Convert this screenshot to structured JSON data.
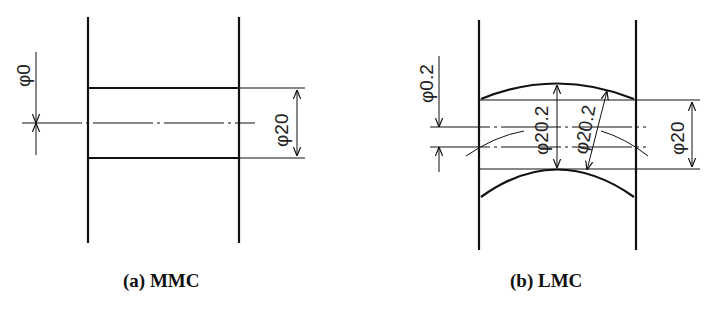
{
  "figure": {
    "panels": [
      {
        "id": "a",
        "caption": "(a) MMC",
        "caption_prefix": "(a)",
        "caption_label": "MMC",
        "dimensions": {
          "position_tolerance": "φ0",
          "hole_diameter": "φ20"
        }
      },
      {
        "id": "b",
        "caption": "(b) LMC",
        "caption_prefix": "(b)",
        "caption_label": "LMC",
        "dimensions": {
          "position_tolerance": "φ0.2",
          "actual_diameter_vertical": "φ20.2",
          "actual_diameter_slanted": "φ20.2",
          "virtual_diameter": "φ20"
        }
      }
    ],
    "colors": {
      "line": "#111111",
      "background": "#ffffff"
    }
  }
}
